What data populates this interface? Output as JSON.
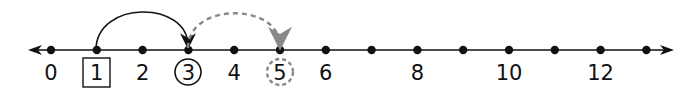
{
  "number_line": {
    "tick_labels": [
      {
        "value": 0,
        "label": "0"
      },
      {
        "value": 1,
        "label": "1",
        "marker": "box"
      },
      {
        "value": 2,
        "label": "2"
      },
      {
        "value": 3,
        "label": "3",
        "marker": "circle"
      },
      {
        "value": 4,
        "label": "4"
      },
      {
        "value": 5,
        "label": "5",
        "marker": "dashed-circle"
      },
      {
        "value": 6,
        "label": "6"
      },
      {
        "value": 7,
        "label": ""
      },
      {
        "value": 8,
        "label": "8"
      },
      {
        "value": 9,
        "label": ""
      },
      {
        "value": 10,
        "label": "10"
      },
      {
        "value": 11,
        "label": ""
      },
      {
        "value": 12,
        "label": "12"
      },
      {
        "value": 13,
        "label": ""
      }
    ],
    "arrows": [
      {
        "from": 1,
        "to": 3,
        "style": "solid",
        "color": "#111111"
      },
      {
        "from": 3,
        "to": 5,
        "style": "dashed",
        "color": "#888888"
      }
    ],
    "colors": {
      "line": "#111111",
      "dashed": "#888888"
    }
  }
}
